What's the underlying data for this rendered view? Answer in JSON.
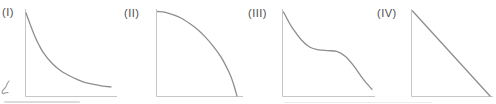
{
  "colors": {
    "curve": "#8e8e8e",
    "axis": "#c6c6c6",
    "label": "#4d4d4d",
    "background": "#ffffff"
  },
  "chart_data": [
    {
      "type": "line",
      "title": "(I)",
      "description": "steep convex decreasing curve (hyperbolic/exponential decay) approaching the x-axis asymptotically",
      "xlabel": "",
      "ylabel": "",
      "xlim": [
        0,
        1
      ],
      "ylim": [
        0,
        1
      ],
      "grid": false,
      "x": [
        0,
        0.05,
        0.1,
        0.15,
        0.2,
        0.3,
        0.4,
        0.5,
        0.6,
        0.7,
        0.8,
        0.9,
        1.0
      ],
      "y": [
        1.0,
        0.86,
        0.73,
        0.62,
        0.53,
        0.4,
        0.31,
        0.25,
        0.2,
        0.16,
        0.14,
        0.12,
        0.11
      ]
    },
    {
      "type": "line",
      "title": "(II)",
      "description": "concave-down decreasing arc (quarter-circle-like), flat at top, steep where it meets the x-axis",
      "xlabel": "",
      "ylabel": "",
      "xlim": [
        0,
        1
      ],
      "ylim": [
        0,
        1
      ],
      "grid": false,
      "x": [
        0,
        0.1,
        0.2,
        0.3,
        0.4,
        0.5,
        0.6,
        0.7,
        0.8,
        0.9,
        0.95,
        1.0
      ],
      "y": [
        1.0,
        0.99,
        0.96,
        0.92,
        0.86,
        0.79,
        0.7,
        0.59,
        0.46,
        0.28,
        0.16,
        0.0
      ]
    },
    {
      "type": "line",
      "title": "(III)",
      "description": "decreasing curve that drops steeply, flattens into a plateau mid-way, then drops steeply again",
      "xlabel": "",
      "ylabel": "",
      "xlim": [
        0,
        1
      ],
      "ylim": [
        0,
        1
      ],
      "grid": false,
      "x": [
        0,
        0.05,
        0.1,
        0.2,
        0.3,
        0.4,
        0.5,
        0.6,
        0.7,
        0.8,
        0.9,
        1.0
      ],
      "y": [
        1.0,
        0.9,
        0.81,
        0.67,
        0.58,
        0.55,
        0.54,
        0.53,
        0.47,
        0.35,
        0.2,
        0.08
      ]
    },
    {
      "type": "line",
      "title": "(IV)",
      "description": "straight diagonal line decreasing linearly from top of y-axis to the end of the x-axis",
      "xlabel": "",
      "ylabel": "",
      "xlim": [
        0,
        1
      ],
      "ylim": [
        0,
        1
      ],
      "grid": false,
      "x": [
        0,
        1.0
      ],
      "y": [
        1.0,
        0.0
      ]
    }
  ],
  "artifacts": {
    "handwriting_fragment": "partial handwritten pen stroke cut off at the left edge of the image",
    "smudge_lines": "faint light-gray horizontal scan-artifact lines along the bottom edge"
  }
}
